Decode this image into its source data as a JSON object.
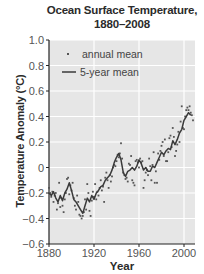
{
  "chart_data": {
    "type": "line",
    "title": "Ocean Surface Temperature,",
    "subtitle": "1880–2008",
    "xlabel": "Year",
    "ylabel": "Temperature Anomaly (°C)",
    "xlim": [
      1880,
      2010
    ],
    "ylim": [
      -0.6,
      1.0
    ],
    "xticks": [
      1880,
      1920,
      1960,
      2000
    ],
    "xtick_labels": [
      "1880",
      "1920",
      "1960",
      "2000"
    ],
    "yticks": [
      -0.6,
      -0.4,
      -0.2,
      0,
      0.2,
      0.4,
      0.6,
      0.8,
      1.0
    ],
    "ytick_labels": [
      "−0.6",
      "−0.4",
      "−0.2",
      "0",
      "0.2",
      "0.4",
      "0.6",
      "0.8",
      "1.0"
    ],
    "grid": true,
    "legend_position": "upper left",
    "legend": [
      "annual mean",
      "5-year mean"
    ],
    "series": [
      {
        "name": "5-year mean",
        "style": "line",
        "x": [
          1880,
          1882,
          1884,
          1886,
          1888,
          1890,
          1892,
          1894,
          1896,
          1898,
          1900,
          1902,
          1904,
          1906,
          1908,
          1910,
          1912,
          1914,
          1916,
          1918,
          1920,
          1922,
          1924,
          1926,
          1928,
          1930,
          1932,
          1934,
          1936,
          1938,
          1940,
          1942,
          1944,
          1946,
          1948,
          1950,
          1952,
          1954,
          1956,
          1958,
          1960,
          1962,
          1964,
          1966,
          1968,
          1970,
          1972,
          1974,
          1976,
          1978,
          1980,
          1982,
          1984,
          1986,
          1988,
          1990,
          1992,
          1994,
          1996,
          1998,
          2000,
          2002,
          2004,
          2006
        ],
        "values": [
          -0.2,
          -0.22,
          -0.19,
          -0.24,
          -0.27,
          -0.22,
          -0.26,
          -0.2,
          -0.17,
          -0.12,
          -0.18,
          -0.25,
          -0.27,
          -0.3,
          -0.33,
          -0.36,
          -0.3,
          -0.24,
          -0.27,
          -0.22,
          -0.25,
          -0.2,
          -0.18,
          -0.15,
          -0.14,
          -0.1,
          -0.08,
          -0.06,
          -0.02,
          0.04,
          0.08,
          0.11,
          0.06,
          -0.04,
          -0.07,
          -0.03,
          -0.02,
          0.0,
          -0.02,
          0.01,
          0.06,
          0.03,
          -0.02,
          0.0,
          -0.03,
          -0.03,
          0.01,
          0.0,
          0.04,
          0.08,
          0.12,
          0.1,
          0.13,
          0.15,
          0.14,
          0.21,
          0.18,
          0.22,
          0.27,
          0.3,
          0.37,
          0.4,
          0.43,
          0.41
        ]
      },
      {
        "name": "annual mean",
        "style": "scatter",
        "x": [
          1880,
          1881,
          1882,
          1883,
          1884,
          1885,
          1886,
          1887,
          1888,
          1889,
          1890,
          1891,
          1892,
          1893,
          1894,
          1895,
          1896,
          1897,
          1898,
          1899,
          1900,
          1901,
          1902,
          1903,
          1904,
          1905,
          1906,
          1907,
          1908,
          1909,
          1910,
          1911,
          1912,
          1913,
          1914,
          1915,
          1916,
          1917,
          1918,
          1919,
          1920,
          1921,
          1922,
          1923,
          1924,
          1925,
          1926,
          1927,
          1928,
          1929,
          1930,
          1931,
          1932,
          1933,
          1934,
          1935,
          1936,
          1937,
          1938,
          1939,
          1940,
          1941,
          1942,
          1943,
          1944,
          1945,
          1946,
          1947,
          1948,
          1949,
          1950,
          1951,
          1952,
          1953,
          1954,
          1955,
          1956,
          1957,
          1958,
          1959,
          1960,
          1961,
          1962,
          1963,
          1964,
          1965,
          1966,
          1967,
          1968,
          1969,
          1970,
          1971,
          1972,
          1973,
          1974,
          1975,
          1976,
          1977,
          1978,
          1979,
          1980,
          1981,
          1982,
          1983,
          1984,
          1985,
          1986,
          1987,
          1988,
          1989,
          1990,
          1991,
          1992,
          1993,
          1994,
          1995,
          1996,
          1997,
          1998,
          1999,
          2000,
          2001,
          2002,
          2003,
          2004,
          2005,
          2006,
          2007,
          2008
        ],
        "values": [
          -0.16,
          -0.2,
          -0.23,
          -0.19,
          -0.27,
          -0.22,
          -0.2,
          -0.33,
          -0.28,
          -0.12,
          -0.31,
          -0.24,
          -0.3,
          -0.35,
          -0.25,
          -0.2,
          -0.09,
          -0.08,
          -0.21,
          -0.14,
          -0.18,
          -0.12,
          -0.24,
          -0.3,
          -0.33,
          -0.22,
          -0.27,
          -0.37,
          -0.38,
          -0.4,
          -0.38,
          -0.35,
          -0.25,
          -0.33,
          -0.13,
          -0.2,
          -0.34,
          -0.38,
          -0.26,
          -0.19,
          -0.23,
          -0.13,
          -0.25,
          -0.19,
          -0.22,
          -0.16,
          -0.1,
          -0.18,
          -0.15,
          -0.27,
          -0.08,
          -0.04,
          -0.1,
          -0.16,
          -0.06,
          -0.11,
          -0.07,
          0.0,
          0.02,
          0.01,
          0.05,
          0.1,
          0.08,
          0.11,
          0.19,
          0.07,
          -0.04,
          -0.06,
          -0.09,
          -0.08,
          -0.11,
          0.03,
          0.02,
          0.09,
          -0.1,
          -0.12,
          -0.14,
          0.05,
          0.06,
          0.04,
          0.0,
          0.07,
          0.04,
          0.05,
          -0.16,
          -0.1,
          -0.04,
          -0.02,
          -0.06,
          0.07,
          0.01,
          -0.1,
          0.02,
          0.12,
          -0.12,
          -0.03,
          -0.12,
          0.11,
          0.06,
          0.13,
          0.17,
          0.2,
          0.09,
          0.22,
          0.05,
          0.05,
          0.12,
          0.23,
          0.25,
          0.16,
          0.31,
          0.24,
          0.09,
          0.13,
          0.18,
          0.28,
          0.2,
          0.36,
          0.48,
          0.31,
          0.3,
          0.4,
          0.45,
          0.47,
          0.45,
          0.48,
          0.43,
          0.41,
          0.37
        ]
      }
    ]
  }
}
